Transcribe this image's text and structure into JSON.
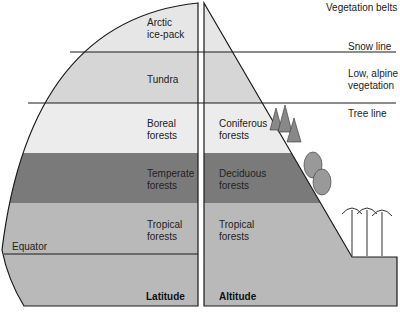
{
  "title": "Vegetation belts",
  "colors": {
    "arctic": "#e6e6e6",
    "tundra": "#d6d6d6",
    "boreal": "#ececec",
    "temperate": "#7a7a7a",
    "tropical": "#b9b9b9",
    "lines": "#1a1a1a"
  },
  "latitude": {
    "axis_label": "Latitude",
    "equator_label": "Equator",
    "bands": [
      {
        "name": "Arctic\nice-pack"
      },
      {
        "name": "Tundra"
      },
      {
        "name": "Boreal\nforests"
      },
      {
        "name": "Temperate\nforests"
      },
      {
        "name": "Tropical\nforests"
      }
    ]
  },
  "altitude": {
    "axis_label": "Altitude",
    "bands": [
      {
        "name": "Coniferous\nforests"
      },
      {
        "name": "Deciduous\nforests"
      },
      {
        "name": "Tropical\nforests"
      }
    ]
  },
  "lines": {
    "snow": "Snow line",
    "alpine": "Low, alpine\nvegetation",
    "tree": "Tree line"
  }
}
